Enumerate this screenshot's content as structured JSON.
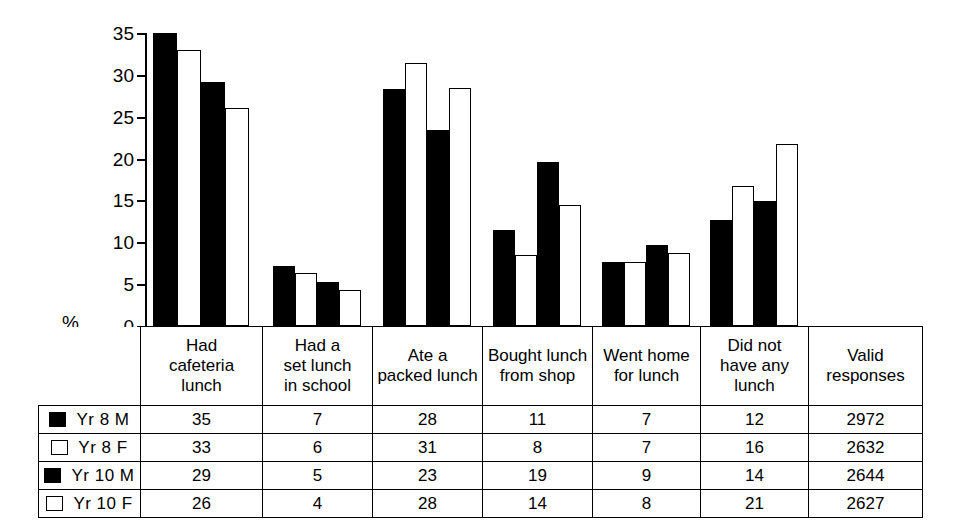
{
  "chart_data": {
    "type": "bar",
    "title": "",
    "xlabel": "",
    "ylabel": "%",
    "ylim": [
      0,
      35
    ],
    "yticks": [
      0,
      5,
      10,
      15,
      20,
      25,
      30,
      35
    ],
    "grid": false,
    "legend_position": "table-left-column",
    "categories": [
      "Had cafeteria lunch",
      "Had a set lunch in school",
      "Ate a packed lunch",
      "Bought lunch from shop",
      "Went home for lunch",
      "Did not have any lunch"
    ],
    "series": [
      {
        "name": "Yr 8 M",
        "fill": "solid",
        "values": [
          35,
          7,
          28,
          11,
          7,
          12
        ],
        "plotted": [
          35.0,
          7.2,
          28.3,
          11.5,
          7.6,
          12.7
        ]
      },
      {
        "name": "Yr 8 F",
        "fill": "hollow",
        "values": [
          33,
          6,
          31,
          8,
          7,
          16
        ],
        "plotted": [
          33.0,
          6.3,
          31.4,
          8.5,
          7.7,
          16.7
        ]
      },
      {
        "name": "Yr 10 M",
        "fill": "solid",
        "values": [
          29,
          5,
          23,
          19,
          9,
          14
        ],
        "plotted": [
          29.2,
          5.3,
          23.4,
          19.6,
          9.7,
          14.9
        ]
      },
      {
        "name": "Yr 10 F",
        "fill": "hollow",
        "values": [
          26,
          4,
          28,
          14,
          8,
          21
        ],
        "plotted": [
          26.1,
          4.3,
          28.4,
          14.5,
          8.7,
          21.8
        ]
      }
    ],
    "valid_responses": [
      2972,
      2632,
      2644,
      2627
    ]
  },
  "axis": {
    "percent_symbol": "%",
    "ticks": [
      "35",
      "30",
      "25",
      "20",
      "15",
      "10",
      "5",
      "0"
    ]
  },
  "table": {
    "category_headers": [
      [
        "Had",
        "cafeteria",
        "lunch"
      ],
      [
        "Had a",
        "set lunch",
        "in school"
      ],
      [
        "Ate a",
        "packed lunch"
      ],
      [
        "Bought lunch",
        "from shop"
      ],
      [
        "Went home",
        "for lunch"
      ],
      [
        "Did not",
        "have any",
        "lunch"
      ],
      [
        "Valid",
        "responses"
      ]
    ],
    "rows": [
      {
        "swatch": "solid",
        "label": "Yr 8 M",
        "cells": [
          "35",
          "7",
          "28",
          "11",
          "7",
          "12",
          "2972"
        ]
      },
      {
        "swatch": "hollow",
        "label": "Yr 8 F",
        "cells": [
          "33",
          "6",
          "31",
          "8",
          "7",
          "16",
          "2632"
        ]
      },
      {
        "swatch": "solid",
        "label": "Yr 10 M",
        "cells": [
          "29",
          "5",
          "23",
          "19",
          "9",
          "14",
          "2644"
        ]
      },
      {
        "swatch": "hollow",
        "label": "Yr 10 F",
        "cells": [
          "26",
          "4",
          "28",
          "14",
          "8",
          "21",
          "2627"
        ]
      }
    ]
  },
  "colors": {
    "ink": "#000000",
    "paper": "#ffffff",
    "solid_series": "#000000",
    "hollow_series": "#ffffff"
  }
}
